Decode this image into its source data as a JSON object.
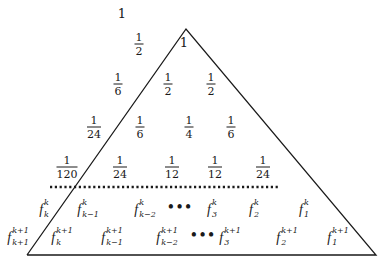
{
  "diagram": {
    "colors": {
      "line": "#1a1a1a",
      "text": "#1a1a1a",
      "background": "#ffffff"
    },
    "triangle": {
      "apex": [
        186,
        29
      ],
      "bottom_left": [
        27,
        255
      ],
      "bottom_right": [
        376,
        255
      ]
    },
    "separator": {
      "style": "dotted",
      "x1": 50,
      "x2": 278,
      "y": 187
    },
    "top_label": {
      "text": "1",
      "x": 122,
      "y": 13
    },
    "apex_label": {
      "text": "1",
      "x": 184,
      "y": 42
    },
    "fraction_rows": [
      {
        "row": 2,
        "items": [
          {
            "num": "1",
            "den": "2",
            "x": 139,
            "y": 44
          }
        ]
      },
      {
        "row": 3,
        "items": [
          {
            "num": "1",
            "den": "6",
            "x": 118,
            "y": 84
          },
          {
            "num": "1",
            "den": "2",
            "x": 168,
            "y": 84
          },
          {
            "num": "1",
            "den": "2",
            "x": 211,
            "y": 84
          }
        ]
      },
      {
        "row": 4,
        "items": [
          {
            "num": "1",
            "den": "24",
            "x": 94,
            "y": 127
          },
          {
            "num": "1",
            "den": "6",
            "x": 140,
            "y": 127
          },
          {
            "num": "1",
            "den": "4",
            "x": 189,
            "y": 127
          },
          {
            "num": "1",
            "den": "6",
            "x": 231,
            "y": 127
          }
        ]
      },
      {
        "row": 5,
        "items": [
          {
            "num": "1",
            "den": "120",
            "x": 67,
            "y": 167
          },
          {
            "num": "1",
            "den": "24",
            "x": 120,
            "y": 167
          },
          {
            "num": "1",
            "den": "12",
            "x": 172,
            "y": 167
          },
          {
            "num": "1",
            "den": "12",
            "x": 215,
            "y": 167
          },
          {
            "num": "1",
            "den": "24",
            "x": 263,
            "y": 167
          }
        ]
      }
    ],
    "f_rows": [
      {
        "items": [
          {
            "type": "f",
            "sup": "k",
            "sub": "k",
            "x": 44,
            "y": 210
          },
          {
            "type": "f",
            "sup": "k",
            "sub": "k−1",
            "x": 88,
            "y": 210
          },
          {
            "type": "f",
            "sup": "k",
            "sub": "k−2",
            "x": 145,
            "y": 210
          },
          {
            "type": "dots",
            "text": "•••",
            "x": 180,
            "y": 207
          },
          {
            "type": "f",
            "sup": "k",
            "sub": "3",
            "x": 212,
            "y": 210
          },
          {
            "type": "f",
            "sup": "k",
            "sub": "2",
            "x": 254,
            "y": 210
          },
          {
            "type": "f",
            "sup": "k",
            "sub": "1",
            "x": 304,
            "y": 210
          }
        ]
      },
      {
        "items": [
          {
            "type": "f",
            "sup": "k+1",
            "sub": "k+1",
            "x": 18,
            "y": 238
          },
          {
            "type": "f",
            "sup": "k+1",
            "sub": "k",
            "x": 62,
            "y": 238
          },
          {
            "type": "f",
            "sup": "k+1",
            "sub": "k−1",
            "x": 112,
            "y": 238
          },
          {
            "type": "f",
            "sup": "k+1",
            "sub": "k−2",
            "x": 167,
            "y": 238
          },
          {
            "type": "dots",
            "text": "•••",
            "x": 203,
            "y": 235
          },
          {
            "type": "f",
            "sup": "k+1",
            "sub": "3",
            "x": 230,
            "y": 238
          },
          {
            "type": "f",
            "sup": "k+1",
            "sub": "2",
            "x": 287,
            "y": 238
          },
          {
            "type": "f",
            "sup": "k+1",
            "sub": "1",
            "x": 338,
            "y": 238
          }
        ]
      }
    ],
    "f_symbol": "f"
  }
}
